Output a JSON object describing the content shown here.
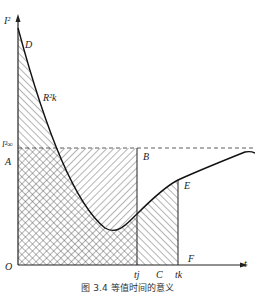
{
  "diagram": {
    "axes": {
      "y_label": "I²",
      "x_label": "t",
      "origin": "O"
    },
    "points": {
      "D": "D",
      "A": "A",
      "B": "B",
      "C": "C",
      "E": "E",
      "F": "F"
    },
    "curve_label": "R²k",
    "dashed_level_label": "I²∞",
    "ticks": {
      "tj": "tj",
      "tk": "tk"
    },
    "caption": "图 3.4   等值时间的意义"
  }
}
